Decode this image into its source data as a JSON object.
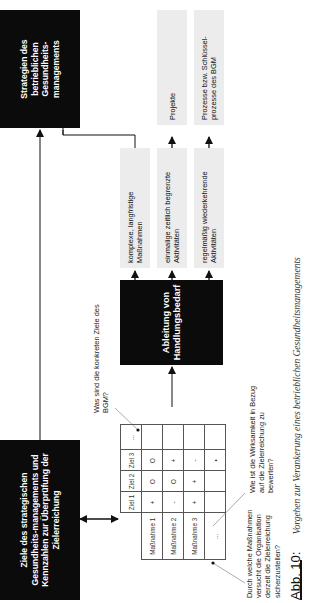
{
  "figure": {
    "caption_number": "Abb. 10:",
    "caption_text": "Vorgehen zur Verankerung eines betrieblichen Gesundheitsmanagements"
  },
  "boxes": {
    "goals": "Ziele des strategischen Gesundheits-managements und Kennzahlen zur Überprüfung der Zielerreichung",
    "derivation": "Ableitung von Handlungsbedarf",
    "strategies": "Strategien des betrieblichen Gesundheits-managements"
  },
  "activities": [
    {
      "label": "komplexe, langfristige Maßnahmen",
      "result": ""
    },
    {
      "label": "einmalige zeitlich begrenzte Aktivitäten",
      "result": "Projekte"
    },
    {
      "label": "regelmäßig wiederkehrende Aktivitäten",
      "result": "Prozesse bzw. Schlüssel-prozesse des BGM"
    }
  ],
  "questions": {
    "goals": "Was sind die konkreten Ziele des BGM?",
    "measures": "Durch welche Maßnahmen versucht die Organisation derzeit die Zielerreichung sicherzustellen?",
    "effectiveness": "Wie ist die Wirksamkeit in Bezug auf die Zielerreichung zu bewerten?"
  },
  "matrix": {
    "columns": [
      "Ziel 1",
      "Ziel 2",
      "Ziel 3",
      "..."
    ],
    "rows": [
      {
        "label": "Maßnahme 1",
        "cells": [
          "+",
          "O",
          "O",
          ""
        ]
      },
      {
        "label": "Maßnahme 2",
        "cells": [
          "-",
          "O",
          "+",
          ""
        ]
      },
      {
        "label": "Maßnahme 3",
        "cells": [
          "+",
          "+",
          "-",
          ""
        ]
      },
      {
        "label": "...",
        "cells": [
          "",
          "",
          "•",
          ""
        ]
      }
    ]
  }
}
